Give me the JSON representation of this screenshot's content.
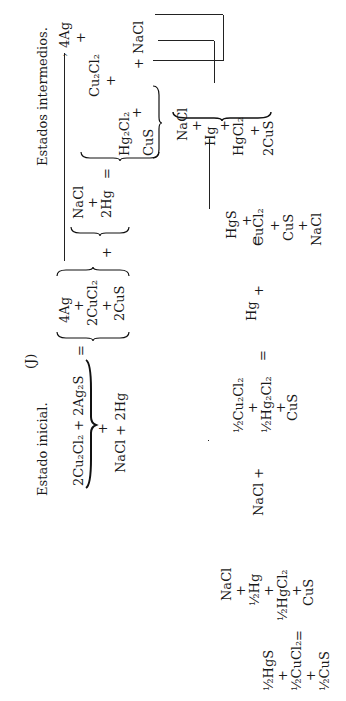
{
  "header": {
    "page_number": "",
    "label": "(J)",
    "estado_inicial": "Estado inicial.",
    "estados_intermedios": "Estados intermedios."
  },
  "initial": {
    "line1": "2Cu₂Cl₂ + 2Ag₂S",
    "plus": "+",
    "line2": "NaCl + 2Hg",
    "equals": "="
  },
  "group1": {
    "items": [
      "4Ag",
      "+",
      "2CuCl₂",
      "+",
      "2CuS"
    ]
  },
  "plus1": "+",
  "group2": {
    "items": [
      "NaCl",
      "+",
      "2Hg"
    ],
    "equals": "="
  },
  "group3": {
    "items": [
      "Cu₂Cl₂",
      "+",
      "Hg₂Cl₂",
      "+",
      "CuS"
    ],
    "plus_nacl": "+ NaCl"
  },
  "top_product": "4Ag",
  "group4": {
    "items": [
      "NaCl",
      "+",
      "Hg",
      "+",
      "HgCl₂",
      "+",
      "2CuS"
    ]
  },
  "equals2": "=",
  "group5": {
    "items": [
      "HgS",
      "+",
      "CuCl₂",
      "+",
      "CuS",
      "+",
      "NaCl"
    ]
  },
  "hg_plus": {
    "hg": "Hg",
    "plus": "+"
  },
  "equals3": "=",
  "group6": {
    "items": [
      "½Cu₂Cl₂",
      "+",
      "½Hg₂Cl₂",
      "+",
      "CuS"
    ]
  },
  "nacl_plus": "NaCl +",
  "group7": {
    "items": [
      "NaCl",
      "+",
      "½Hg",
      "+",
      "½HgCl₂",
      "+",
      "CuS"
    ]
  },
  "equals4": "=",
  "group8": {
    "items": [
      "½HgS",
      "+",
      "½CuCl₂",
      "+",
      "½CuS"
    ]
  }
}
